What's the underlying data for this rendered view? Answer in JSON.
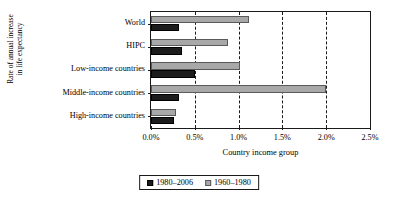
{
  "chart_data": {
    "type": "bar",
    "orientation": "horizontal",
    "title": "",
    "xlabel": "Country income group",
    "ylabel_line1": "Rate of annual increase",
    "ylabel_line2": "in life expectancy",
    "categories": [
      "World",
      "HIPC",
      "Low-income countries",
      "Middle-income countries",
      "High-income countries"
    ],
    "series": [
      {
        "name": "1980–2006",
        "color": "#1c1c1c",
        "values": [
          0.32,
          0.35,
          0.5,
          0.32,
          0.26
        ]
      },
      {
        "name": "1960–1980",
        "color": "#a8a8a8",
        "values": [
          1.12,
          0.88,
          1.02,
          2.0,
          0.29
        ]
      }
    ],
    "xlim": [
      0.0,
      2.5
    ],
    "xticks": [
      0.0,
      0.5,
      1.0,
      1.5,
      2.0,
      2.5
    ],
    "xticklabels": [
      "0.0%",
      "0.5%",
      "1.0%",
      "1.5%",
      "2.0%",
      "2.5%"
    ],
    "grid": "vertical-dashed",
    "legend_position": "bottom-center",
    "legend": [
      "1980–2006",
      "1960–1980"
    ]
  }
}
